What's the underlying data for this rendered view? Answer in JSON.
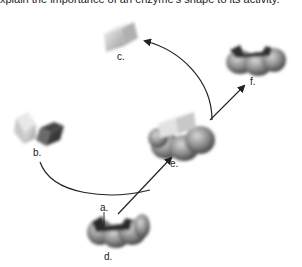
{
  "caption_fragment": "xplain the importance of an enzyme's shape to its activity.",
  "labels": {
    "a": "a.",
    "b": "b.",
    "c": "c.",
    "d": "d.",
    "e": "e.",
    "f": "f."
  },
  "parts": [
    {
      "id": "a",
      "description": "active site slot on enzyme d"
    },
    {
      "id": "b",
      "description": "two substrate blocks"
    },
    {
      "id": "c",
      "description": "joined product"
    },
    {
      "id": "d",
      "description": "enzyme with active site"
    },
    {
      "id": "e",
      "description": "enzyme-substrate complex"
    },
    {
      "id": "f",
      "description": "released enzyme"
    }
  ],
  "colors": {
    "shape_dark": "#3a3a3a",
    "shape_mid": "#8a8a8a",
    "shape_light": "#d8d8d8",
    "arrow": "#222222"
  }
}
